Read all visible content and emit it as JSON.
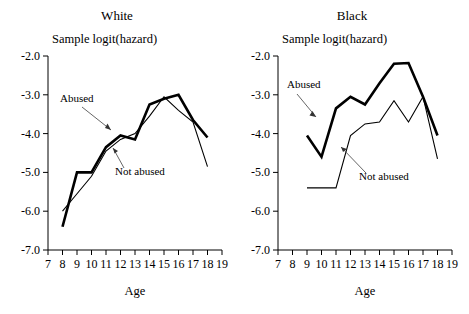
{
  "figure": {
    "caption_none": "",
    "axis_title_y": "Sample logit(hazard)",
    "axis_title_x": "Age"
  },
  "panels": [
    {
      "id": "white",
      "title": "White",
      "y_title": "Sample logit(hazard)",
      "x_title": "Age",
      "y_ticks": [
        "-2.0",
        "-3.0",
        "-4.0",
        "-5.0",
        "-6.0",
        "-7.0"
      ],
      "x_ticks": [
        "7",
        "8",
        "9",
        "10",
        "11",
        "12",
        "13",
        "14",
        "15",
        "16",
        "17",
        "18",
        "19"
      ],
      "annotations": [
        {
          "label": "Abused"
        },
        {
          "label": "Not abused"
        }
      ]
    },
    {
      "id": "black",
      "title": "Black",
      "y_title": "Sample logit(hazard)",
      "x_title": "Age",
      "y_ticks": [
        "-2.0",
        "-3.0",
        "-4.0",
        "-5.0",
        "-6.0",
        "-7.0"
      ],
      "x_ticks": [
        "7",
        "8",
        "9",
        "10",
        "11",
        "12",
        "13",
        "14",
        "15",
        "16",
        "17",
        "18",
        "19"
      ],
      "annotations": [
        {
          "label": "Abused"
        },
        {
          "label": "Not abused"
        }
      ]
    }
  ],
  "chart_data": [
    {
      "type": "line",
      "title": "White",
      "xlabel": "Age",
      "ylabel": "Sample logit(hazard)",
      "xlim": [
        7,
        19
      ],
      "ylim": [
        -7.0,
        -2.0
      ],
      "xticks": [
        7,
        8,
        9,
        10,
        11,
        12,
        13,
        14,
        15,
        16,
        17,
        18,
        19
      ],
      "yticks": [
        -2.0,
        -3.0,
        -4.0,
        -5.0,
        -6.0,
        -7.0
      ],
      "grid": false,
      "legend_position": "inline-annotation",
      "series": [
        {
          "name": "Abused",
          "style": "thick",
          "x": [
            8,
            9,
            10,
            11,
            12,
            13,
            14,
            15,
            16,
            17,
            18
          ],
          "y": [
            -6.4,
            -5.0,
            -5.0,
            -4.35,
            -4.05,
            -4.15,
            -3.25,
            -3.1,
            -3.0,
            -3.65,
            -4.1
          ]
        },
        {
          "name": "Not abused",
          "style": "thin",
          "x": [
            8,
            9,
            10,
            11,
            12,
            13,
            14,
            15,
            16,
            17,
            18
          ],
          "y": [
            -6.0,
            -5.55,
            -5.1,
            -4.45,
            -4.15,
            -4.0,
            -3.55,
            -3.05,
            -3.4,
            -3.7,
            -4.85
          ]
        }
      ]
    },
    {
      "type": "line",
      "title": "Black",
      "xlabel": "Age",
      "ylabel": "Sample logit(hazard)",
      "xlim": [
        7,
        19
      ],
      "ylim": [
        -7.0,
        -2.0
      ],
      "xticks": [
        7,
        8,
        9,
        10,
        11,
        12,
        13,
        14,
        15,
        16,
        17,
        18,
        19
      ],
      "yticks": [
        -2.0,
        -3.0,
        -4.0,
        -5.0,
        -6.0,
        -7.0
      ],
      "grid": false,
      "legend_position": "inline-annotation",
      "series": [
        {
          "name": "Abused",
          "style": "thick",
          "x": [
            9,
            10,
            11,
            12,
            13,
            14,
            15,
            16,
            17,
            18
          ],
          "y": [
            -4.05,
            -4.6,
            -3.35,
            -3.05,
            -3.25,
            -2.7,
            -2.2,
            -2.18,
            -3.05,
            -4.05
          ]
        },
        {
          "name": "Not abused",
          "style": "thin",
          "x": [
            9,
            10,
            11,
            12,
            13,
            14,
            15,
            16,
            17,
            18
          ],
          "y": [
            -5.4,
            -5.4,
            -5.4,
            -4.05,
            -3.75,
            -3.7,
            -3.15,
            -3.7,
            -3.05,
            -4.65
          ]
        }
      ]
    }
  ]
}
